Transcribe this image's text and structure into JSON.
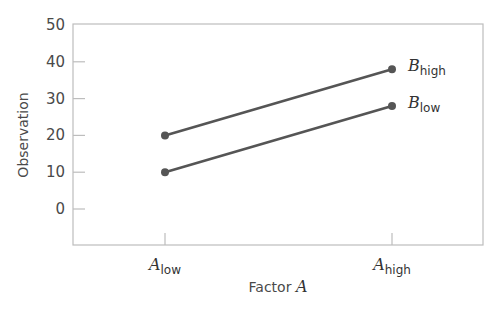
{
  "chart_data": {
    "type": "line",
    "title": "",
    "xlabel": "Factor A",
    "xlabel_main": "Factor ",
    "xlabel_var": "A",
    "ylabel": "Observation",
    "ylim": [
      -10,
      50
    ],
    "yticks": [
      0,
      10,
      20,
      30,
      40,
      50
    ],
    "categories": [
      "A_low",
      "A_high"
    ],
    "category_labels": [
      {
        "var": "A",
        "sub": "low"
      },
      {
        "var": "A",
        "sub": "high"
      }
    ],
    "series": [
      {
        "name": "B_high",
        "var": "B",
        "sub": "high",
        "values": [
          20,
          38
        ]
      },
      {
        "name": "B_low",
        "var": "B",
        "sub": "low",
        "values": [
          10,
          28
        ]
      }
    ],
    "grid": false,
    "legend_position": "inline-right",
    "colors": {
      "line": "#555555",
      "axis": "#bdbdbd",
      "text": "#4a4a4a"
    }
  }
}
